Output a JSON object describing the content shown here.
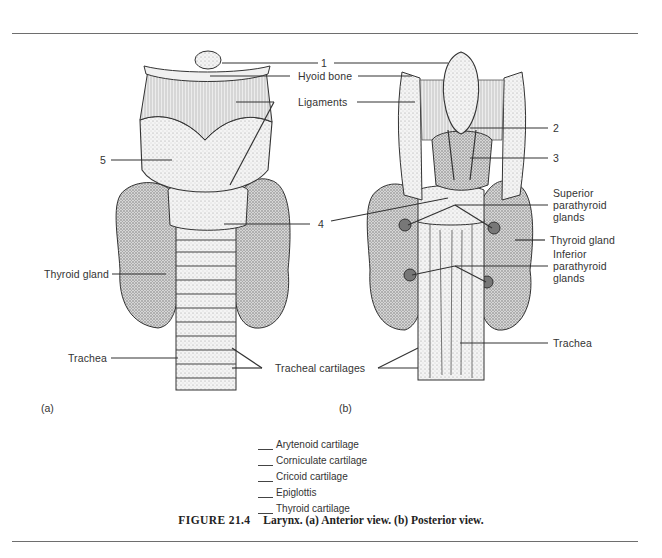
{
  "figure": {
    "number": "FIGURE 21.4",
    "title": "Larynx. (a) Anterior view. (b) Posterior view."
  },
  "panels": {
    "a": {
      "tag": "(a)",
      "view": "Anterior view"
    },
    "b": {
      "tag": "(b)",
      "view": "Posterior view"
    }
  },
  "labels": {
    "num1": "1",
    "hyoid_bone": "Hyoid bone",
    "ligaments": "Ligaments",
    "num2": "2",
    "num3": "3",
    "num4": "4",
    "num5": "5",
    "superior_parathyroid": "Superior parathyroid glands",
    "thyroid_gland_right": "Thyroid gland",
    "inferior_parathyroid": "Inferior parathyroid glands",
    "thyroid_gland_left": "Thyroid gland",
    "trachea_left": "Trachea",
    "trachea_right": "Trachea",
    "tracheal_cartilages": "Tracheal cartilages"
  },
  "answer_key": {
    "items": [
      {
        "blank": "",
        "label": "Arytenoid cartilage"
      },
      {
        "blank": "",
        "label": "Corniculate cartilage"
      },
      {
        "blank": "",
        "label": "Cricoid cartilage"
      },
      {
        "blank": "",
        "label": "Epiglottis"
      },
      {
        "blank": "",
        "label": "Thyroid cartilage"
      }
    ]
  },
  "colors": {
    "ink": "#2a2a2a",
    "rule": "#6e6e6e",
    "stipple": "#8a8a8a",
    "background": "#ffffff"
  }
}
